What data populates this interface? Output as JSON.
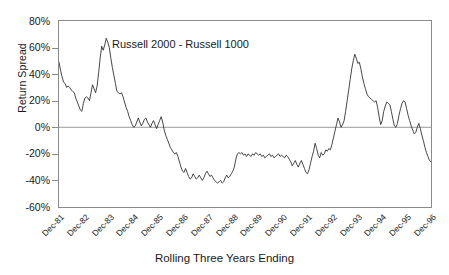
{
  "chart_data": {
    "type": "line",
    "title": "",
    "annotation": "Russell 2000 - Russell 1000",
    "xlabel": "Rolling Three Years Ending",
    "ylabel": "Return Spread",
    "ylim": [
      -60,
      80
    ],
    "ytick_labels": [
      "80%",
      "60%",
      "40%",
      "20%",
      "0%",
      "-20%",
      "-40%",
      "-60%"
    ],
    "ytick_values": [
      80,
      60,
      40,
      20,
      0,
      -20,
      -40,
      -60
    ],
    "xtick_labels": [
      "Dec-81",
      "Dec-82",
      "Dec-83",
      "Dec-84",
      "Dec-85",
      "Dec-86",
      "Dec-87",
      "Dec-88",
      "Dec-89",
      "Dec-90",
      "Dec-91",
      "Dec-92",
      "Dec-93",
      "Dec-94",
      "Dec-95",
      "Dec-96"
    ],
    "grid": false,
    "zero_line": true,
    "legend": "none",
    "line_color": "#333333",
    "series": [
      {
        "name": "Russell 2000 - Russell 1000",
        "values": [
          49,
          43,
          38,
          34,
          33,
          30,
          31,
          30,
          28,
          27,
          26,
          22,
          19,
          16,
          13,
          12,
          18,
          22,
          23,
          22,
          20,
          26,
          32,
          29,
          26,
          31,
          41,
          52,
          61,
          58,
          62,
          67,
          64,
          60,
          52,
          45,
          39,
          33,
          27,
          26,
          25,
          26,
          23,
          19,
          15,
          12,
          8,
          5,
          2,
          0,
          1,
          4,
          7,
          4,
          1,
          3,
          6,
          7,
          4,
          2,
          0,
          3,
          5,
          2,
          -1,
          2,
          5,
          8,
          4,
          -2,
          -6,
          -9,
          -12,
          -15,
          -17,
          -19,
          -20,
          -19,
          -22,
          -26,
          -30,
          -33,
          -34,
          -31,
          -34,
          -37,
          -39,
          -38,
          -35,
          -37,
          -39,
          -38,
          -36,
          -38,
          -40,
          -38,
          -35,
          -33,
          -35,
          -37,
          -36,
          -38,
          -40,
          -41,
          -42,
          -41,
          -40,
          -42,
          -41,
          -38,
          -36,
          -38,
          -37,
          -35,
          -33,
          -30,
          -24,
          -20,
          -19,
          -20,
          -19,
          -21,
          -20,
          -22,
          -20,
          -21,
          -22,
          -20,
          -21,
          -19,
          -20,
          -21,
          -20,
          -22,
          -21,
          -23,
          -22,
          -21,
          -20,
          -22,
          -21,
          -23,
          -22,
          -21,
          -20,
          -22,
          -21,
          -22,
          -23,
          -21,
          -22,
          -24,
          -26,
          -29,
          -27,
          -25,
          -28,
          -30,
          -27,
          -25,
          -28,
          -31,
          -34,
          -35,
          -32,
          -27,
          -22,
          -18,
          -12,
          -16,
          -21,
          -23,
          -19,
          -21,
          -20,
          -17,
          -18,
          -16,
          -17,
          -13,
          -8,
          -3,
          2,
          7,
          4,
          0,
          2,
          5,
          12,
          20,
          28,
          36,
          44,
          50,
          55,
          52,
          48,
          49,
          44,
          38,
          33,
          29,
          25,
          23,
          22,
          21,
          20,
          19,
          20,
          15,
          8,
          2,
          5,
          12,
          16,
          19,
          18,
          17,
          12,
          6,
          1,
          0,
          3,
          9,
          14,
          18,
          20,
          19,
          14,
          9,
          5,
          1,
          -2,
          -5,
          -4,
          0,
          3,
          -1,
          -6,
          -10,
          -15,
          -19,
          -22,
          -25,
          -26
        ]
      }
    ]
  }
}
